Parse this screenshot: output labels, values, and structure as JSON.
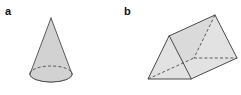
{
  "figure": {
    "background_color": "#ffffff",
    "panels": [
      {
        "id": "a",
        "label": "a",
        "shape_name": "cone",
        "fill_color": "#d2d2d2",
        "stroke_color": "#4a4a4a",
        "hidden_edge_style": "dashed",
        "geometry": {
          "apex": [
            51,
            18
          ],
          "base_center": [
            51,
            74
          ],
          "base_radius_x": 21,
          "base_radius_y": 8,
          "height": 56
        }
      },
      {
        "id": "b",
        "label": "b",
        "shape_name": "triangular-prism",
        "fill_color": "#e2e2e2",
        "fill_color_shaded": "#dadada",
        "stroke_color": "#4a4a4a",
        "hidden_edge_style": "dashed",
        "geometry": {
          "near_triangle": {
            "apex": [
              169,
              36
            ],
            "left": [
              148,
              79
            ],
            "right": [
              191,
              79
            ]
          },
          "far_triangle": {
            "apex": [
              215,
              15
            ],
            "left": [
              194,
              58
            ],
            "right": [
              237,
              58
            ]
          },
          "orientation": "lying-on-side-extending-upper-right"
        }
      }
    ]
  }
}
